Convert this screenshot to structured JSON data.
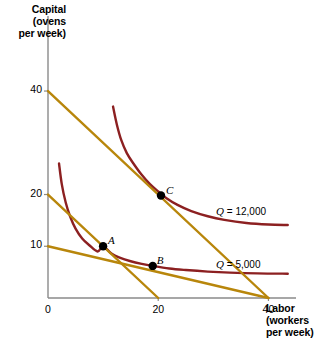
{
  "chart_data": {
    "type": "line",
    "title": "",
    "xlabel": "Labor (workers per week)",
    "ylabel": "Capital (ovens per week)",
    "xlim": [
      0,
      45
    ],
    "ylim": [
      0,
      46
    ],
    "grid": false,
    "legend_position": "inline-right",
    "xticks": [
      0,
      20,
      40
    ],
    "yticks": [
      10,
      20,
      40
    ],
    "series": [
      {
        "name": "Q = 5,000",
        "kind": "isoquant",
        "color": "#8c2021",
        "points": [
          [
            2.0,
            26.0
          ],
          [
            2.5,
            22.0
          ],
          [
            3.2,
            18.5
          ],
          [
            4.0,
            15.8
          ],
          [
            5.0,
            13.4
          ],
          [
            6.2,
            11.5
          ],
          [
            7.5,
            10.2
          ],
          [
            9.0,
            9.0
          ],
          [
            10.0,
            10.0
          ],
          [
            11.5,
            8.6
          ],
          [
            13.0,
            7.8
          ],
          [
            15.0,
            7.1
          ],
          [
            17.0,
            6.6
          ],
          [
            19.0,
            6.2
          ],
          [
            22.0,
            5.7
          ],
          [
            25.0,
            5.4
          ],
          [
            29.0,
            5.1
          ],
          [
            33.0,
            4.9
          ],
          [
            38.0,
            4.75
          ],
          [
            43.5,
            4.7
          ]
        ]
      },
      {
        "name": "Q = 12,000",
        "kind": "isoquant",
        "color": "#8c2021",
        "points": [
          [
            11.8,
            37.0
          ],
          [
            12.5,
            33.5
          ],
          [
            13.3,
            30.5
          ],
          [
            14.3,
            28.0
          ],
          [
            15.5,
            26.0
          ],
          [
            17.0,
            23.8
          ],
          [
            18.5,
            22.0
          ],
          [
            20.0,
            20.6
          ],
          [
            21.5,
            19.3
          ],
          [
            23.5,
            18.0
          ],
          [
            26.0,
            16.8
          ],
          [
            29.0,
            15.8
          ],
          [
            32.0,
            15.1
          ],
          [
            36.0,
            14.5
          ],
          [
            40.0,
            14.2
          ],
          [
            43.5,
            14.1
          ]
        ]
      },
      {
        "name": "isocost-40",
        "kind": "isocost",
        "color": "#b8860b",
        "points": [
          [
            0.0,
            40.0
          ],
          [
            40.0,
            0.0
          ]
        ]
      },
      {
        "name": "isocost-20",
        "kind": "isocost",
        "color": "#b8860b",
        "points": [
          [
            0.0,
            20.0
          ],
          [
            20.0,
            0.0
          ]
        ]
      },
      {
        "name": "isocost-10",
        "kind": "isocost",
        "color": "#b8860b",
        "points": [
          [
            0.0,
            10.0
          ],
          [
            40.0,
            0.0
          ]
        ]
      }
    ],
    "annotations": [
      {
        "label": "A",
        "x": 10.0,
        "y": 10.0,
        "label_dx": 5,
        "label_dy": -9
      },
      {
        "label": "B",
        "x": 19.0,
        "y": 6.2,
        "label_dx": 4,
        "label_dy": -9
      },
      {
        "label": "C",
        "x": 20.5,
        "y": 19.8,
        "label_dx": 5,
        "label_dy": -9
      }
    ],
    "curve_labels": [
      {
        "text": "Q",
        "rest": " = 12,000",
        "x": 30.5,
        "y": 16.6,
        "key": "q12k"
      },
      {
        "text": "Q",
        "rest": " = 5,000",
        "x": 30.5,
        "y": 6.4,
        "key": "q5k"
      }
    ]
  },
  "axes": {
    "y_title": "Capital\n(ovens\nper week)",
    "x_title": "Labor\n(workers\nper week)",
    "x_tick_labels": [
      "0",
      "20",
      "40"
    ],
    "y_tick_labels": [
      "10",
      "20",
      "40"
    ]
  },
  "labels": {
    "point_a": "A",
    "point_b": "B",
    "point_c": "C",
    "q12000": "Q = 12,000",
    "q5000": "Q = 5,000"
  },
  "colors": {
    "isoquant": "#8c2021",
    "isocost": "#b8860b",
    "axis": "#8a8a8a",
    "point": "#000000",
    "text": "#000000",
    "background": "#ffffff"
  }
}
